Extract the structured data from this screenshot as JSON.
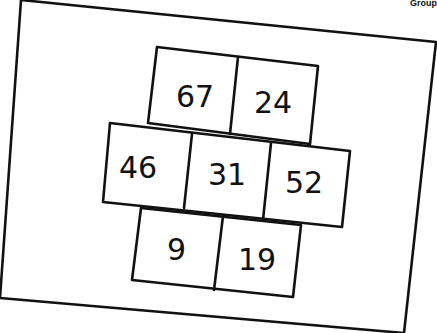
{
  "corner_label": "Group",
  "diagram": {
    "type": "number-grid",
    "rows": [
      {
        "cells": [
          "67",
          "24"
        ]
      },
      {
        "cells": [
          "46",
          "31",
          "52"
        ]
      },
      {
        "cells": [
          "9",
          "19"
        ]
      }
    ]
  },
  "colors": {
    "ink": "#111111",
    "paper": "#ffffff"
  }
}
